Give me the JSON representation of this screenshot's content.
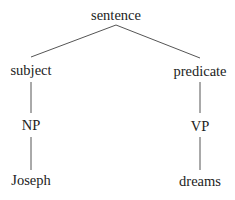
{
  "diagram": {
    "type": "syntax-tree",
    "nodes": {
      "root": "sentence",
      "left_child": "subject",
      "right_child": "predicate",
      "left_phrase": "NP",
      "right_phrase": "VP",
      "left_leaf": "Joseph",
      "right_leaf": "dreams"
    },
    "edges": [
      [
        "sentence",
        "subject"
      ],
      [
        "sentence",
        "predicate"
      ],
      [
        "subject",
        "NP"
      ],
      [
        "predicate",
        "VP"
      ],
      [
        "NP",
        "Joseph"
      ],
      [
        "VP",
        "dreams"
      ]
    ]
  }
}
